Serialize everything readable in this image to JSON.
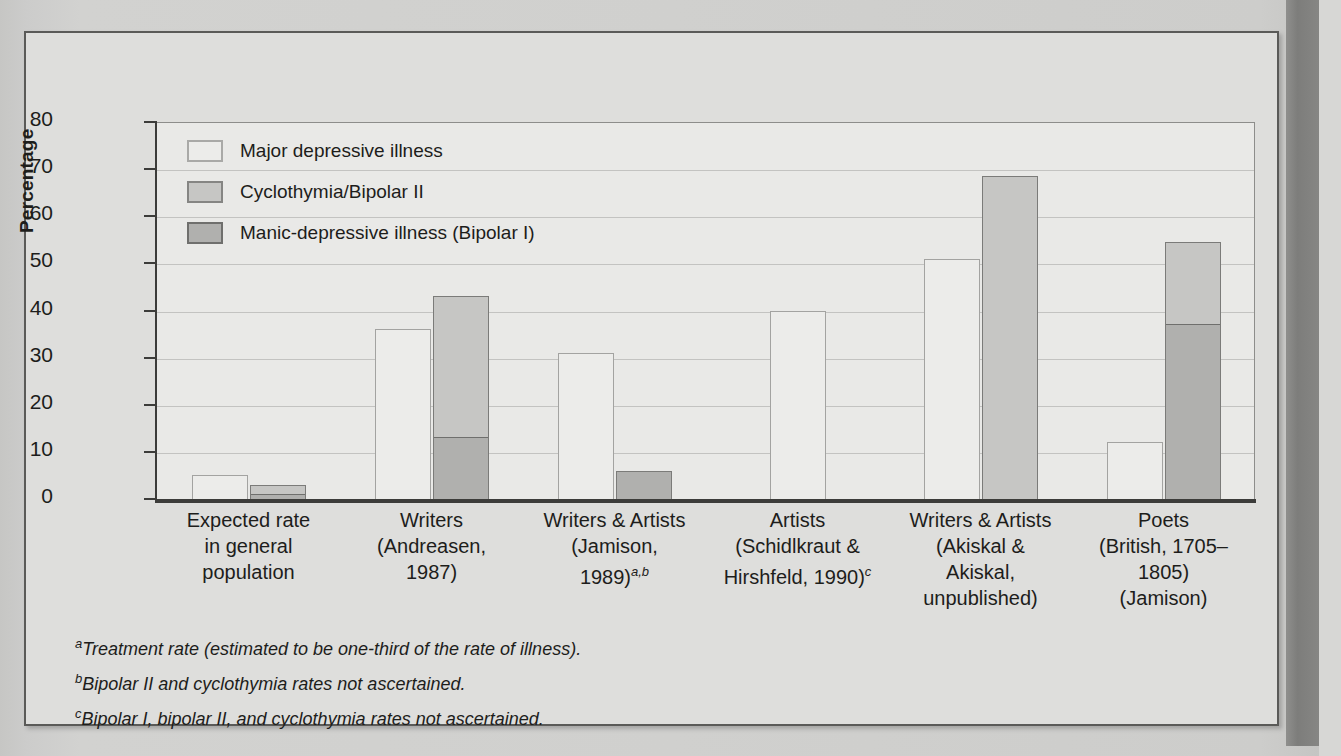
{
  "figure": {
    "y_axis_title": "Percentage",
    "legend": [
      {
        "label": "Major depressive illness",
        "color": "#ececea"
      },
      {
        "label": "Cyclothymia/Bipolar II",
        "color": "#c6c6c4"
      },
      {
        "label": "Manic-depressive illness (Bipolar I)",
        "color": "#b0b0ae"
      }
    ],
    "footnotes": [
      {
        "marker": "a",
        "text": "Treatment rate (estimated to be one-third of the rate of illness)."
      },
      {
        "marker": "b",
        "text": "Bipolar II and cyclothymia rates not ascertained."
      },
      {
        "marker": "c",
        "text": "Bipolar I, bipolar II, and cyclothymia rates not ascertained."
      }
    ]
  },
  "chart_data": {
    "type": "bar",
    "title": "",
    "xlabel": "",
    "ylabel": "Percentage",
    "ylim": [
      0,
      80
    ],
    "yticks": [
      0,
      10,
      20,
      30,
      40,
      50,
      60,
      70,
      80
    ],
    "grid": true,
    "legend_position": "top-left",
    "stacked": true,
    "categories": [
      {
        "lines": [
          "Expected rate",
          "in general",
          "population"
        ],
        "footnote": ""
      },
      {
        "lines": [
          "Writers",
          "(Andreasen,",
          "1987)"
        ],
        "footnote": ""
      },
      {
        "lines": [
          "Writers & Artists",
          "(Jamison,",
          "1989)"
        ],
        "footnote": "a,b"
      },
      {
        "lines": [
          "Artists",
          "(Schidlkraut &",
          "Hirshfeld, 1990)"
        ],
        "footnote": "c"
      },
      {
        "lines": [
          "Writers & Artists",
          "(Akiskal &",
          "Akiskal,",
          "unpublished)"
        ],
        "footnote": ""
      },
      {
        "lines": [
          "Poets",
          "(British, 1705–1805)",
          "(Jamison)"
        ],
        "footnote": ""
      }
    ],
    "series": [
      {
        "name": "Major depressive illness",
        "color": "#ececea",
        "values": [
          5,
          36,
          31,
          40,
          51,
          12
        ]
      },
      {
        "name": "Cyclothymia/Bipolar II",
        "color": "#c6c6c4",
        "values": [
          2,
          30,
          0,
          0,
          68.5,
          17.5
        ]
      },
      {
        "name": "Manic-depressive illness (Bipolar I)",
        "color": "#b0b0ae",
        "values": [
          1,
          13,
          6,
          0,
          0,
          37
        ]
      }
    ],
    "bars": [
      {
        "group": "Expected rate in general population",
        "columns": [
          {
            "segments": [
              {
                "series": "Major depressive illness",
                "value": 5,
                "color": "#ececea"
              }
            ],
            "total": 5
          },
          {
            "segments": [
              {
                "series": "Manic-depressive illness (Bipolar I)",
                "value": 1,
                "color": "#b0b0ae"
              },
              {
                "series": "Cyclothymia/Bipolar II",
                "value": 2,
                "color": "#c6c6c4"
              }
            ],
            "total": 3
          }
        ]
      },
      {
        "group": "Writers (Andreasen, 1987)",
        "columns": [
          {
            "segments": [
              {
                "series": "Major depressive illness",
                "value": 36,
                "color": "#ececea"
              }
            ],
            "total": 36
          },
          {
            "segments": [
              {
                "series": "Manic-depressive illness (Bipolar I)",
                "value": 13,
                "color": "#b0b0ae"
              },
              {
                "series": "Cyclothymia/Bipolar II",
                "value": 30,
                "color": "#c6c6c4"
              }
            ],
            "total": 43
          }
        ]
      },
      {
        "group": "Writers & Artists (Jamison, 1989)",
        "columns": [
          {
            "segments": [
              {
                "series": "Major depressive illness",
                "value": 31,
                "color": "#ececea"
              }
            ],
            "total": 31
          },
          {
            "segments": [
              {
                "series": "Manic-depressive illness (Bipolar I)",
                "value": 6,
                "color": "#b0b0ae"
              }
            ],
            "total": 6
          }
        ]
      },
      {
        "group": "Artists (Schidlkraut & Hirshfeld, 1990)",
        "columns": [
          {
            "segments": [
              {
                "series": "Major depressive illness",
                "value": 40,
                "color": "#ececea"
              }
            ],
            "total": 40
          }
        ]
      },
      {
        "group": "Writers & Artists (Akiskal & Akiskal, unpublished)",
        "columns": [
          {
            "segments": [
              {
                "series": "Major depressive illness",
                "value": 51,
                "color": "#ececea"
              }
            ],
            "total": 51
          },
          {
            "segments": [
              {
                "series": "Cyclothymia/Bipolar II",
                "value": 68.5,
                "color": "#c6c6c4"
              }
            ],
            "total": 68.5
          }
        ]
      },
      {
        "group": "Poets (British, 1705–1805) (Jamison)",
        "columns": [
          {
            "segments": [
              {
                "series": "Major depressive illness",
                "value": 12,
                "color": "#ececea"
              }
            ],
            "total": 12
          },
          {
            "segments": [
              {
                "series": "Manic-depressive illness (Bipolar I)",
                "value": 37,
                "color": "#b0b0ae"
              },
              {
                "series": "Cyclothymia/Bipolar II",
                "value": 17.5,
                "color": "#c6c6c4"
              }
            ],
            "total": 54.5
          }
        ]
      }
    ]
  },
  "page_background_text": {
    "col_left": [
      "",
      "",
      "",
      ""
    ]
  }
}
